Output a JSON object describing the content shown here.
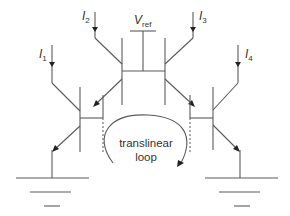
{
  "diagram": {
    "type": "circuit-schematic",
    "currents": [
      {
        "id": "I1",
        "symbol": "I",
        "subscript": "1"
      },
      {
        "id": "I2",
        "symbol": "I",
        "subscript": "2"
      },
      {
        "id": "I3",
        "symbol": "I",
        "subscript": "3"
      },
      {
        "id": "I4",
        "symbol": "I",
        "subscript": "4"
      }
    ],
    "vref": {
      "symbol": "V",
      "subscript": "ref"
    },
    "loop_label": {
      "line1": "translinear",
      "line2": "loop"
    },
    "colors": {
      "wire": "#5a5a5a",
      "arrowhead": "#222222",
      "text": "#333333",
      "background": "#ffffff"
    }
  }
}
